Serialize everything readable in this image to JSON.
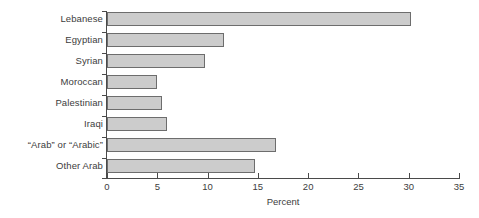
{
  "chart_data": {
    "type": "bar",
    "orientation": "horizontal",
    "title": "",
    "xlabel": "Percent",
    "ylabel": "",
    "xlim": [
      0,
      35
    ],
    "xticks": [
      0,
      5,
      10,
      15,
      20,
      25,
      30,
      35
    ],
    "xtick_labels": [
      "0",
      "5",
      "10",
      "15",
      "20",
      "25",
      "30",
      "35"
    ],
    "grid": false,
    "legend": null,
    "categories": [
      "Lebanese",
      "Egyptian",
      "Syrian",
      "Moroccan",
      "Palestinian",
      "Iraqi",
      "“Arab” or “Arabic”",
      "Other Arab"
    ],
    "values": [
      30.2,
      11.6,
      9.7,
      5.0,
      5.5,
      6.0,
      16.8,
      14.7
    ],
    "bar_fill_color": "#cccccc",
    "bar_border_color": "#6d6d6d",
    "axis_color": "#4a4a4a",
    "background_color": "#ffffff"
  }
}
